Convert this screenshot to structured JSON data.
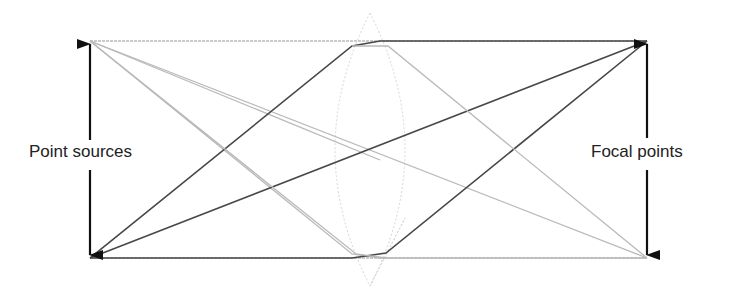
{
  "diagram": {
    "type": "optics-ray-diagram",
    "labels": {
      "left": "Point sources",
      "right": "Focal points"
    },
    "colors": {
      "dark_ray": "#444444",
      "light_ray": "#b8b8b8",
      "lens_outline": "#d4d4d4",
      "arrow": "#111111"
    },
    "points": {
      "source_top": [
        90,
        41
      ],
      "source_bottom": [
        90,
        258
      ],
      "focal_top": [
        647,
        41
      ],
      "focal_bottom": [
        647,
        258
      ]
    },
    "lens": {
      "center_x": 370,
      "top_y": 13,
      "bottom_y": 286,
      "half_width": 38
    }
  }
}
